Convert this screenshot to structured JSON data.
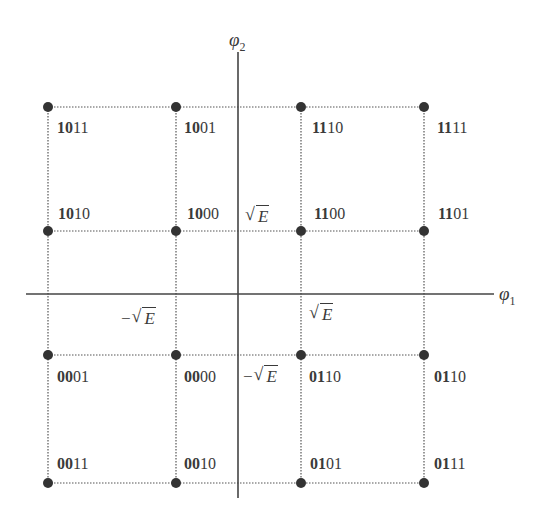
{
  "diagram": {
    "type": "16-QAM signal constellation",
    "axes": {
      "horizontal_label": "φ",
      "horizontal_sub": "1",
      "vertical_label": "φ",
      "vertical_sub": "2"
    },
    "tick_labels": {
      "pos_x": "E",
      "neg_x": "E",
      "pos_y": "E",
      "neg_y": "E",
      "minus": "−",
      "radical": "√"
    },
    "points": [
      {
        "row": 0,
        "col": 0,
        "bold": "10",
        "rest": "11"
      },
      {
        "row": 0,
        "col": 1,
        "bold": "10",
        "rest": "01"
      },
      {
        "row": 0,
        "col": 2,
        "bold": "11",
        "rest": "10"
      },
      {
        "row": 0,
        "col": 3,
        "bold": "11",
        "rest": "11"
      },
      {
        "row": 1,
        "col": 0,
        "bold": "10",
        "rest": "10"
      },
      {
        "row": 1,
        "col": 1,
        "bold": "10",
        "rest": "00"
      },
      {
        "row": 1,
        "col": 2,
        "bold": "11",
        "rest": "00"
      },
      {
        "row": 1,
        "col": 3,
        "bold": "11",
        "rest": "01"
      },
      {
        "row": 2,
        "col": 0,
        "bold": "00",
        "rest": "01"
      },
      {
        "row": 2,
        "col": 1,
        "bold": "00",
        "rest": "00"
      },
      {
        "row": 2,
        "col": 2,
        "bold": "01",
        "rest": "10"
      },
      {
        "row": 2,
        "col": 3,
        "bold": "01",
        "rest": "10"
      },
      {
        "row": 3,
        "col": 0,
        "bold": "00",
        "rest": "11"
      },
      {
        "row": 3,
        "col": 1,
        "bold": "00",
        "rest": "10"
      },
      {
        "row": 3,
        "col": 2,
        "bold": "01",
        "rest": "01"
      },
      {
        "row": 3,
        "col": 3,
        "bold": "01",
        "rest": "11"
      }
    ],
    "colors": {
      "ink": "#3a3a3a",
      "dot": "#333333",
      "background": "#ffffff"
    }
  }
}
